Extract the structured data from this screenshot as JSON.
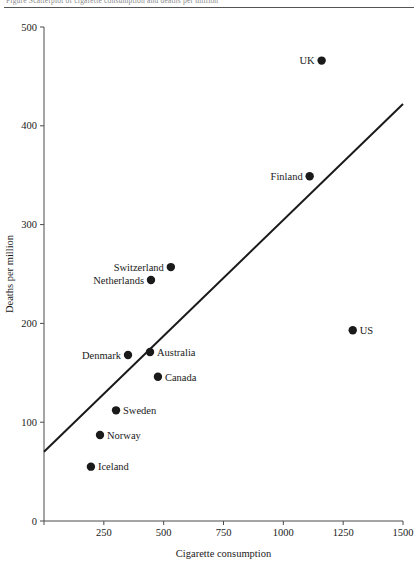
{
  "figure": {
    "top_caption": "Figure   Scatterplot of cigarette consumption and deaths per million"
  },
  "chart_data": {
    "type": "scatter",
    "title": "",
    "xlabel": "Cigarette consumption",
    "ylabel": "Deaths per million",
    "xlim": [
      0,
      1500
    ],
    "ylim": [
      0,
      500
    ],
    "xticks": [
      0,
      250,
      500,
      750,
      1000,
      1250,
      1500
    ],
    "xtick_labels": [
      "",
      "250",
      "500",
      "750",
      "1000",
      "1250",
      "1500"
    ],
    "yticks": [
      0,
      100,
      200,
      300,
      400,
      500
    ],
    "ytick_labels": [
      "0",
      "100",
      "200",
      "300",
      "400",
      "500"
    ],
    "grid": false,
    "legend": "none",
    "marker_color": "#1a1a1a",
    "line_color": "#1a1a1a",
    "points": [
      {
        "label": "UK",
        "x": 1160,
        "y": 466,
        "label_side": "left"
      },
      {
        "label": "Finland",
        "x": 1110,
        "y": 349,
        "label_side": "left"
      },
      {
        "label": "Switzerland",
        "x": 530,
        "y": 257,
        "label_side": "left"
      },
      {
        "label": "Netherlands",
        "x": 447,
        "y": 244,
        "label_side": "left"
      },
      {
        "label": "US",
        "x": 1290,
        "y": 193,
        "label_side": "right"
      },
      {
        "label": "Australia",
        "x": 443,
        "y": 171,
        "label_side": "right"
      },
      {
        "label": "Denmark",
        "x": 351,
        "y": 168,
        "label_side": "left"
      },
      {
        "label": "Canada",
        "x": 476,
        "y": 146,
        "label_side": "right"
      },
      {
        "label": "Sweden",
        "x": 301,
        "y": 112,
        "label_side": "right"
      },
      {
        "label": "Norway",
        "x": 234,
        "y": 87,
        "label_side": "right"
      },
      {
        "label": "Iceland",
        "x": 196,
        "y": 55,
        "label_side": "right"
      }
    ],
    "fit_line": {
      "x0": 0,
      "y0": 70,
      "x1": 1500,
      "y1": 422
    }
  }
}
